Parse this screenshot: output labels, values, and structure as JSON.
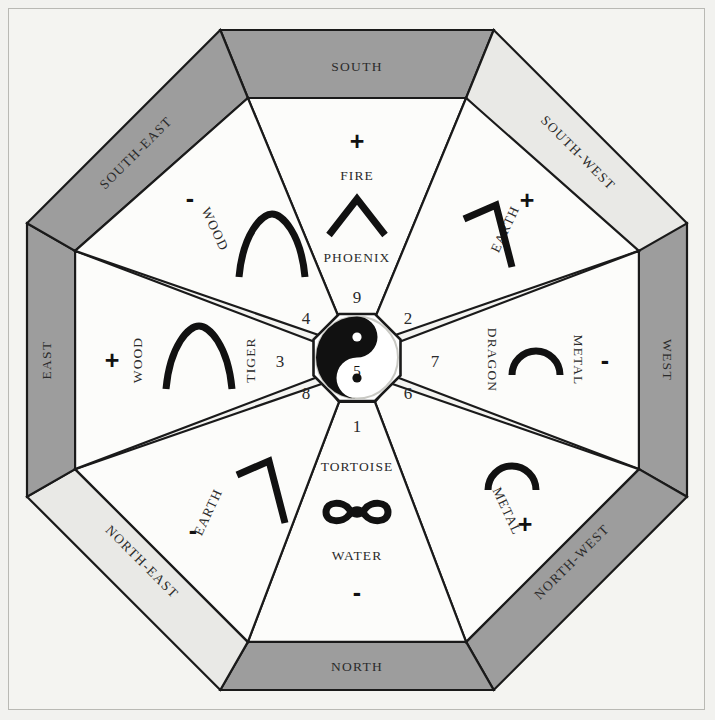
{
  "diagram": {
    "colors": {
      "page_background": "#f2f2ef",
      "panel_background": "#f4f4f1",
      "ring_dark": "#9d9d9d",
      "ring_light": "#e9e9e6",
      "sector_fill": "#fcfcfa",
      "line": "#1a1a1a",
      "text": "#2b2b2b"
    },
    "center": {
      "symbol": "yin-yang-icon",
      "number": "5"
    },
    "directions": [
      {
        "id": "south",
        "name": "SOUTH",
        "band_shade": "dark",
        "number": "9",
        "element": "FIRE",
        "animal": "PHOENIX",
        "polarity": "+",
        "glyph": "chevron-up-glyph"
      },
      {
        "id": "south-west",
        "name": "SOUTH-WEST",
        "band_shade": "light",
        "number": "2",
        "element": "EARTH",
        "animal": "",
        "polarity": "+",
        "glyph": "angle-bracket-glyph"
      },
      {
        "id": "west",
        "name": "WEST",
        "band_shade": "dark",
        "number": "7",
        "element": "METAL",
        "animal": "DRAGON",
        "polarity": "-",
        "glyph": "dome-arc-glyph"
      },
      {
        "id": "north-west",
        "name": "NORTH-WEST",
        "band_shade": "dark",
        "number": "6",
        "element": "METAL",
        "animal": "",
        "polarity": "+",
        "glyph": "dome-arc-glyph"
      },
      {
        "id": "north",
        "name": "NORTH",
        "band_shade": "dark",
        "number": "1",
        "element": "WATER",
        "animal": "TORTOISE",
        "polarity": "-",
        "glyph": "bone-glyph"
      },
      {
        "id": "north-east",
        "name": "NORTH-EAST",
        "band_shade": "light",
        "number": "8",
        "element": "EARTH",
        "animal": "",
        "polarity": "-",
        "glyph": "angle-bracket-glyph"
      },
      {
        "id": "east",
        "name": "EAST",
        "band_shade": "dark",
        "number": "3",
        "element": "WOOD",
        "animal": "TIGER",
        "polarity": "+",
        "glyph": "arch-glyph"
      },
      {
        "id": "south-east",
        "name": "SOUTH-EAST",
        "band_shade": "dark",
        "number": "4",
        "element": "WOOD",
        "animal": "",
        "polarity": "-",
        "glyph": "arch-glyph"
      }
    ]
  }
}
